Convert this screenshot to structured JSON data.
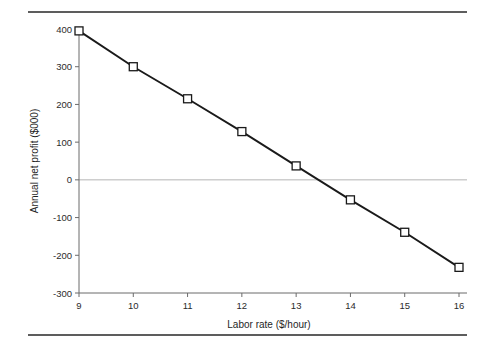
{
  "figure": {
    "background_color": "#ffffff",
    "rule_color": "#5d5d5d",
    "has_top_rule": true,
    "has_bottom_rule": true
  },
  "chart_data": {
    "type": "line",
    "title": "",
    "subtitle": "",
    "xlabel": "Labor rate ($/hour)",
    "ylabel": "Annual net profit ($000)",
    "x": [
      9,
      10,
      11,
      12,
      13,
      14,
      15,
      16
    ],
    "values": [
      395,
      300,
      215,
      128,
      37,
      -53,
      -139,
      -232
    ],
    "series": [
      {
        "name": "Annual net profit",
        "x": [
          9,
          10,
          11,
          12,
          13,
          14,
          15,
          16
        ],
        "values": [
          395,
          300,
          215,
          128,
          37,
          -53,
          -139,
          -232
        ],
        "line_color": "#1a1a1a",
        "marker": "square",
        "marker_fill": "#ffffff",
        "marker_edge_color": "#1a1a1a"
      }
    ],
    "xlim": [
      9,
      16
    ],
    "ylim": [
      -300,
      400
    ],
    "xticks": [
      9,
      10,
      11,
      12,
      13,
      14,
      15,
      16
    ],
    "yticks": [
      400,
      300,
      200,
      100,
      0,
      -100,
      -200,
      -300
    ],
    "xtick_labels": [
      "9",
      "10",
      "11",
      "12",
      "13",
      "14",
      "15",
      "16"
    ],
    "ytick_labels": [
      "400",
      "300",
      "200",
      "100",
      "0",
      "-100",
      "-200",
      "-300"
    ],
    "grid": false,
    "zero_reference_line": {
      "value": 0,
      "color": "#b4b4b4",
      "visible": true
    },
    "legend": {
      "visible": false,
      "position": "none",
      "entries": []
    },
    "annotations": [],
    "breakeven_note": ""
  }
}
